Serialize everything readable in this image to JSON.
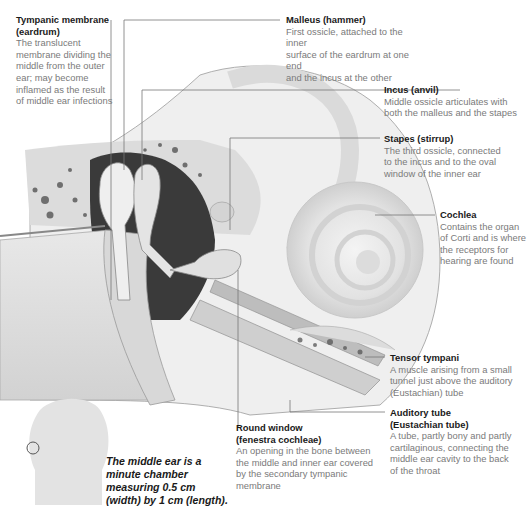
{
  "diagram": {
    "labels": [
      {
        "id": "tympanic-membrane",
        "title": "Tympanic membrane (eardrum)",
        "title_lines": [
          "Tympanic membrane",
          "(eardrum)"
        ],
        "desc_lines": [
          "The translucent",
          "membrane dividing the",
          "middle from the outer",
          "ear; may become",
          "inflamed as the result",
          "of middle ear infections"
        ]
      },
      {
        "id": "malleus",
        "title": "Malleus (hammer)",
        "title_lines": [
          "Malleus (hammer)"
        ],
        "desc_lines": [
          "First ossicle, attached to the inner",
          "surface of the eardrum at one end",
          "and the incus at the other"
        ]
      },
      {
        "id": "incus",
        "title": "Incus (anvil)",
        "title_lines": [
          "Incus (anvil)"
        ],
        "desc_lines": [
          "Middle ossicle articulates with",
          "both the malleus and the stapes"
        ]
      },
      {
        "id": "stapes",
        "title": "Stapes (stirrup)",
        "title_lines": [
          "Stapes (stirrup)"
        ],
        "desc_lines": [
          "The third ossicle, connected",
          "to the incus and to the oval",
          "window of the inner ear"
        ]
      },
      {
        "id": "cochlea",
        "title": "Cochlea",
        "title_lines": [
          "Cochlea"
        ],
        "desc_lines": [
          "Contains the organ",
          "of Corti and is where",
          "the receptors for",
          "hearing are found"
        ]
      },
      {
        "id": "tensor-tympani",
        "title": "Tensor tympani",
        "title_lines": [
          "Tensor tympani"
        ],
        "desc_lines": [
          "A muscle arising from a small",
          "tunnel just above the auditory",
          "(Eustachian) tube"
        ]
      },
      {
        "id": "auditory-tube",
        "title": "Auditory tube (Eustachian tube)",
        "title_lines": [
          "Auditory tube",
          "(Eustachian tube)"
        ],
        "desc_lines": [
          "A tube, partly bony and partly",
          "cartilaginous, connecting the",
          "middle ear cavity to the back",
          "of the throat"
        ]
      },
      {
        "id": "round-window",
        "title": "Round window (fenestra cochleae)",
        "title_lines": [
          "Round window",
          "(fenestra cochleae)"
        ],
        "desc_lines": [
          "An opening in the bone between",
          "the middle and inner ear covered",
          "by the secondary tympanic",
          "membrane"
        ]
      }
    ],
    "caption_lines": [
      "The middle ear is a",
      "minute chamber",
      "measuring 0.5 cm",
      "(width) by 1 cm (length)."
    ]
  },
  "colors": {
    "title": "#1a1a1a",
    "desc": "#7a7a7a",
    "leader": "#777777",
    "bone": "#e6e6e6",
    "cavity": "#3a3a3a"
  }
}
